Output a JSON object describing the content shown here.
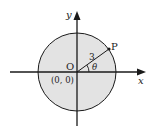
{
  "diagram": {
    "type": "circle-on-coordinate-plane",
    "labels": {
      "y_axis": "y",
      "x_axis": "x",
      "origin": "O",
      "origin_coords": "(0, 0)",
      "point": "P",
      "radius": "3",
      "angle": "θ"
    },
    "colors": {
      "circle_fill": "#e3e3e3",
      "stroke": "#1a1a1a",
      "background": "#ffffff"
    }
  }
}
